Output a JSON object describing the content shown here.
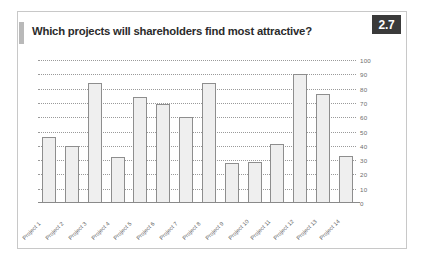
{
  "card": {
    "title": "Which projects will shareholders find most attractive?",
    "badge": "2.7",
    "accent_color": "#3a3a3a",
    "bar_fill": "#efefef",
    "bar_stroke": "#8e8e8e",
    "grid_color": "#9a9a9a"
  },
  "chart_data": {
    "type": "bar",
    "title": "Which projects will shareholders find most attractive?",
    "xlabel": "",
    "ylabel": "",
    "ylim": [
      0,
      100
    ],
    "ytick_step": 10,
    "yticks": [
      0,
      10,
      20,
      30,
      40,
      50,
      60,
      70,
      80,
      90,
      100
    ],
    "ytick_labels": [
      "0",
      "10",
      "20",
      "30",
      "40",
      "50",
      "60",
      "70",
      "80",
      "90",
      "100"
    ],
    "y_axis_position": "right",
    "grid": true,
    "grid_style": "dotted",
    "legend": false,
    "categories": [
      "Project 1",
      "Project 2",
      "Project 3",
      "Project 4",
      "Project 5",
      "Project 6",
      "Project 7",
      "Project 8",
      "Project 9",
      "Project 10",
      "Project 11",
      "Project 12",
      "Project 13",
      "Project 14"
    ],
    "values": [
      46,
      40,
      84,
      32,
      74,
      69,
      60,
      84,
      28,
      29,
      41,
      90,
      76,
      33
    ]
  }
}
